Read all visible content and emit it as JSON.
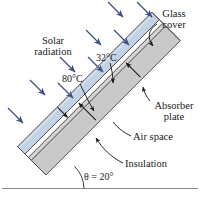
{
  "figure": {
    "type": "flat-plate-solar-collector-cross-section",
    "background": "#ffffff"
  },
  "labels": {
    "solar_radiation_line1": "Solar",
    "solar_radiation_line2": "radiation",
    "glass_cover_line1": "Glass",
    "glass_cover_line2": "cover",
    "absorber_plate_line1": "Absorber",
    "absorber_plate_line2": "plate",
    "air_space": "Air space",
    "insulation": "Insulation",
    "temp_cover": "32°C",
    "temp_absorber": "80°C",
    "angle": "θ = 20°"
  },
  "values": {
    "cover_temperature_c": 32,
    "absorber_temperature_c": 80,
    "tilt_angle_deg": 20
  },
  "colors": {
    "glass_cover": "#c3d2e4",
    "glass_cover_edge": "#8fa3bd",
    "absorber_plate": "#c9c9c9",
    "insulation": "#c9c9c9",
    "air_space": "#ffffff",
    "outline": "#4a4a4a",
    "solar_arrow": "#3d4f86",
    "leader": "#1a1a1a",
    "ground_line": "#8a8a8a",
    "text": "#1a1a1a"
  },
  "solar_arrows": {
    "count": 9,
    "direction_deg": 45,
    "color": "#3d4f86"
  }
}
